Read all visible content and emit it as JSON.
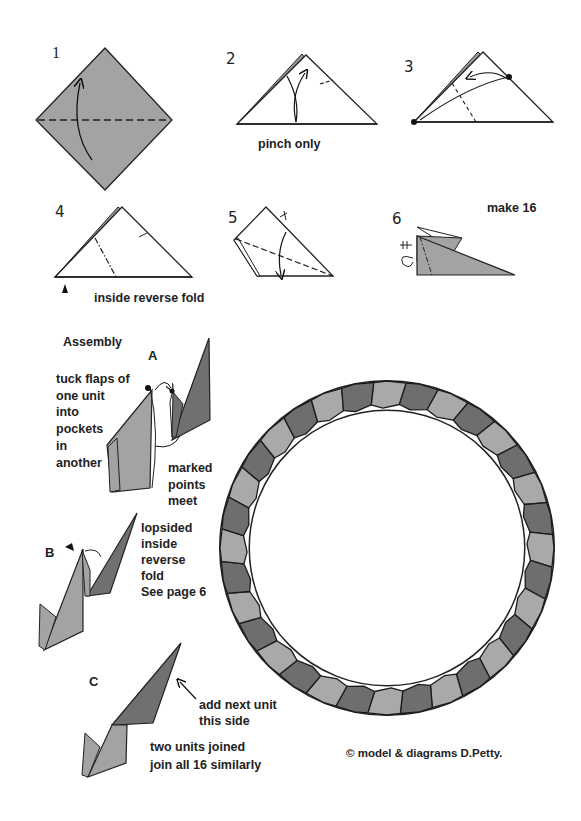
{
  "steps": [
    {
      "number": "1"
    },
    {
      "number": "2",
      "caption": "pinch only"
    },
    {
      "number": "3"
    },
    {
      "number": "4",
      "caption": "inside reverse fold"
    },
    {
      "number": "5"
    },
    {
      "number": "6",
      "note": "make 16"
    }
  ],
  "assembly": {
    "title": "Assembly",
    "A": {
      "letter": "A",
      "instruction": "tuck flaps of\none unit\ninto\npockets\nin\nanother",
      "note": "marked\npoints\nmeet"
    },
    "B": {
      "letter": "B",
      "instruction": "lopsided\ninside\nreverse\nfold\nSee page 6"
    },
    "C": {
      "letter": "C",
      "arrow_note": "add next unit\nthis side",
      "caption": "two units joined\njoin all 16 similarly"
    }
  },
  "ring": {
    "units": 16,
    "colors": {
      "dark": "#6e6e6e",
      "light": "#a9a9a9",
      "paper": "#a0a0a0",
      "outline": "#1a1a1a"
    }
  },
  "copyright": "©  model & diagrams D.Petty."
}
